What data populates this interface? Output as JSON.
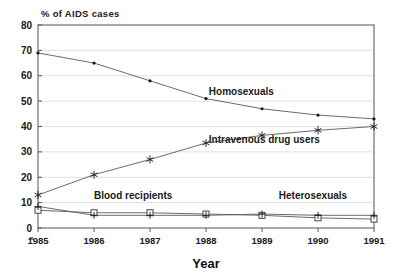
{
  "chart_data": {
    "type": "line",
    "title": "",
    "ylabel": "% of AIDS cases",
    "xlabel": "Year",
    "categories": [
      "1985",
      "1986",
      "1987",
      "1988",
      "1989",
      "1990",
      "1991"
    ],
    "x": [
      1985,
      1986,
      1987,
      1988,
      1989,
      1990,
      1991
    ],
    "ylim": [
      0,
      80
    ],
    "y_ticks": [
      "0",
      "10",
      "20",
      "30",
      "40",
      "50",
      "60",
      "70",
      "80"
    ],
    "y_tick_values": [
      0,
      10,
      20,
      30,
      40,
      50,
      60,
      70,
      80
    ],
    "grid": true,
    "legend_position": "inline-annotations",
    "series": [
      {
        "name": "Homosexuals",
        "marker": "dot",
        "values": [
          69,
          65,
          58,
          51,
          47,
          44.5,
          43
        ],
        "label_x": 1988.05,
        "label_y": 52.5
      },
      {
        "name": "Intravenous drug users",
        "marker": "star",
        "values": [
          13,
          21,
          27,
          33.5,
          36.5,
          38.5,
          40
        ],
        "label_x": 1988.05,
        "label_y": 33.5
      },
      {
        "name": "Blood recipients",
        "marker": "square",
        "values": [
          7,
          6,
          6,
          5.5,
          5,
          4,
          3.5
        ],
        "label_x": 1986.0,
        "label_y": 11.5
      },
      {
        "name": "Heterosexuals",
        "marker": "plus",
        "values": [
          8.5,
          5,
          5,
          5,
          5.5,
          5,
          5
        ],
        "label_x": 1989.3,
        "label_y": 11.5
      }
    ],
    "origin_marker": "«"
  },
  "colors": {
    "line": "#5a5a5a",
    "frame": "#555555",
    "grid": "#d8d8d8",
    "text": "#1a1a1a",
    "background": "#ffffff"
  }
}
